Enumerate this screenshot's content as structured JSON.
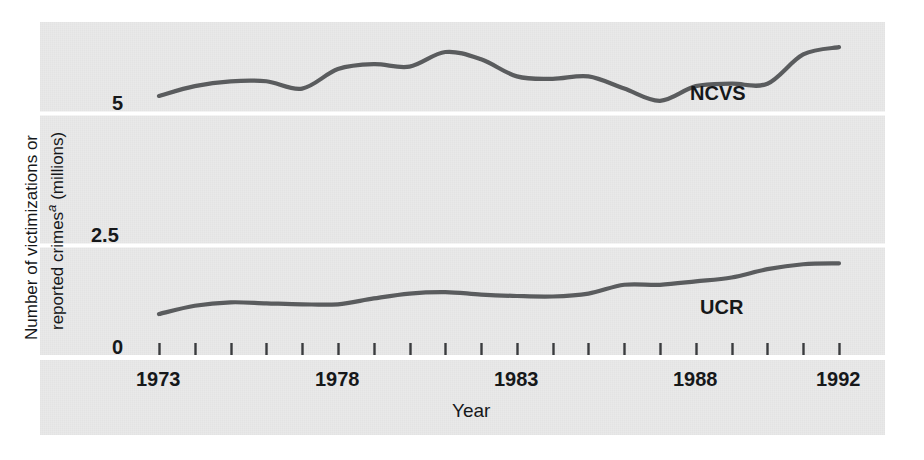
{
  "figure": {
    "background_color": "#ffffff",
    "panel_color": "#e9e9e9",
    "line_color": "#5a5c5e",
    "gridline_color": "#ffffff",
    "text_color": "#16181a"
  },
  "axes": {
    "y_title_part1": "Number of victimizations or",
    "y_title_part2_pre": "reported crimes",
    "y_title_footnote": "a",
    "y_title_part2_post": " (millions)",
    "y_ticks": [
      "5",
      "2.5",
      "0"
    ],
    "y_tick_values": [
      5,
      2.5,
      0
    ],
    "x_title": "Year",
    "x_tick_labels": [
      "1973",
      "1978",
      "1983",
      "1988",
      "1992"
    ],
    "x_tick_values": [
      1973,
      1978,
      1983,
      1988,
      1992
    ],
    "x_minor_tick_years": [
      1973,
      1974,
      1975,
      1976,
      1977,
      1978,
      1979,
      1980,
      1981,
      1982,
      1983,
      1984,
      1985,
      1986,
      1987,
      1988,
      1989,
      1990,
      1991,
      1992
    ]
  },
  "series_labels": {
    "ncvs": "NCVS",
    "ucr": "UCR"
  },
  "chart_data": {
    "type": "line",
    "title": "",
    "xlabel": "Year",
    "ylabel": "Number of victimizations or reported crimes (millions)",
    "xlim": [
      1973,
      1992
    ],
    "ylim": [
      0,
      7.0
    ],
    "grid": true,
    "gridlines_y": [
      0,
      2.5,
      5
    ],
    "legend_position": "inline-right",
    "x": [
      1973,
      1974,
      1975,
      1976,
      1977,
      1978,
      1979,
      1980,
      1981,
      1982,
      1983,
      1984,
      1985,
      1986,
      1987,
      1988,
      1989,
      1990,
      1991,
      1992
    ],
    "series": [
      {
        "name": "NCVS",
        "values": [
          5.35,
          5.55,
          5.65,
          5.65,
          5.5,
          5.9,
          6.0,
          5.95,
          6.25,
          6.1,
          5.75,
          5.7,
          5.75,
          5.5,
          5.25,
          5.55,
          5.6,
          5.6,
          6.2,
          6.35
        ]
      },
      {
        "name": "UCR",
        "values": [
          0.88,
          1.05,
          1.12,
          1.1,
          1.08,
          1.08,
          1.2,
          1.3,
          1.33,
          1.28,
          1.25,
          1.24,
          1.3,
          1.48,
          1.48,
          1.55,
          1.63,
          1.8,
          1.9,
          1.92
        ]
      }
    ]
  }
}
